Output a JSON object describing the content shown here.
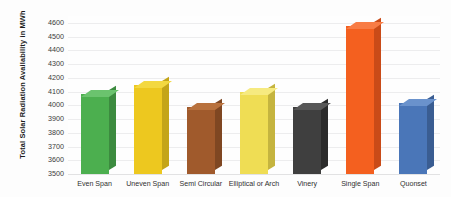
{
  "chart_data": {
    "type": "bar",
    "title": "",
    "xlabel": "",
    "ylabel": "Total Solar Radiation Availability in MWh",
    "categories": [
      "Even Span",
      "Uneven Span",
      "Semi Circular",
      "Elliptical or Arch",
      "Vinery",
      "Single Span",
      "Quonset"
    ],
    "values": [
      4080,
      4145,
      3990,
      4100,
      3985,
      4580,
      4015
    ],
    "ylim": [
      3500,
      4650
    ],
    "yticks": [
      3500,
      3600,
      3700,
      3800,
      3900,
      4000,
      4100,
      4200,
      4300,
      4400,
      4500,
      4600
    ],
    "ytick_labels": [
      "3500",
      "3600",
      "3700",
      "3800",
      "3900",
      "4000",
      "4100",
      "4200",
      "4300",
      "4400",
      "4500",
      "4600"
    ],
    "grid": true,
    "legend": false,
    "bar_style": "3d-column",
    "colors": [
      "#4caf4f",
      "#edc81f",
      "#a05a2c",
      "#efdd54",
      "#3f3f3f",
      "#f4601f",
      "#4a76b8"
    ],
    "side_colors": [
      "#3c8b3f",
      "#c4a518",
      "#7f4722",
      "#c5b43f",
      "#2b2b2b",
      "#c94b18",
      "#3a5d92"
    ],
    "top_colors": [
      "#6bc36e",
      "#f3d840",
      "#b8713d",
      "#f6ea80",
      "#575757",
      "#f87c45",
      "#6a92cc"
    ]
  },
  "axis": {
    "y_title": "Total Solar Radiation Availability in MWh"
  }
}
